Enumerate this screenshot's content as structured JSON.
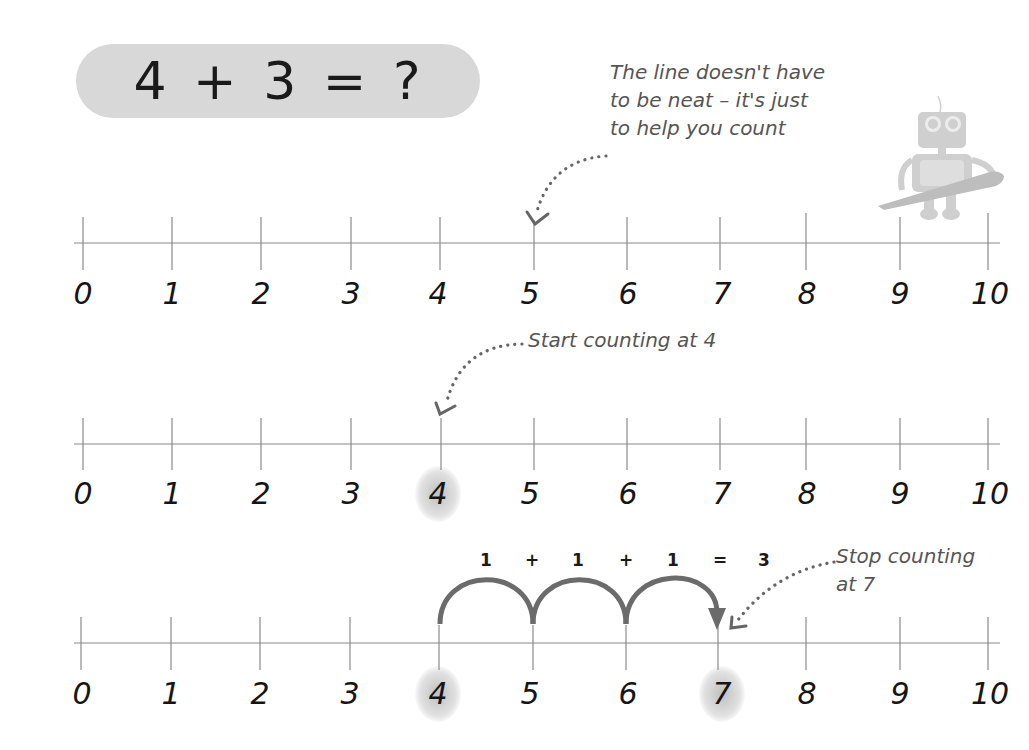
{
  "equation": {
    "text": "4 + 3 = ?"
  },
  "notes": {
    "line_note": "The line doesn't have\nto be neat – it's just\nto help you count",
    "start_note": "Start counting at 4",
    "stop_note": "Stop counting\nat 7"
  },
  "number_lines": [
    {
      "labels": [
        "0",
        "1",
        "2",
        "3",
        "4",
        "5",
        "6",
        "7",
        "8",
        "9",
        "10"
      ],
      "highlighted": []
    },
    {
      "labels": [
        "0",
        "1",
        "2",
        "3",
        "4",
        "5",
        "6",
        "7",
        "8",
        "9",
        "10"
      ],
      "highlighted": [
        "4"
      ]
    },
    {
      "labels": [
        "0",
        "1",
        "2",
        "3",
        "4",
        "5",
        "6",
        "7",
        "8",
        "9",
        "10"
      ],
      "highlighted": [
        "4",
        "7"
      ]
    }
  ],
  "jumps": {
    "labels": [
      "1",
      "+",
      "1",
      "+",
      "1",
      "=",
      "3"
    ],
    "from": 4,
    "to": 7,
    "count": 3
  },
  "colors": {
    "pill_bg": "#d8d8d8",
    "arc": "#6b6b6b",
    "note_text": "#555555",
    "line": "#8a8a8a"
  },
  "illustration": {
    "icon": "robot-holding-pencil-icon"
  }
}
